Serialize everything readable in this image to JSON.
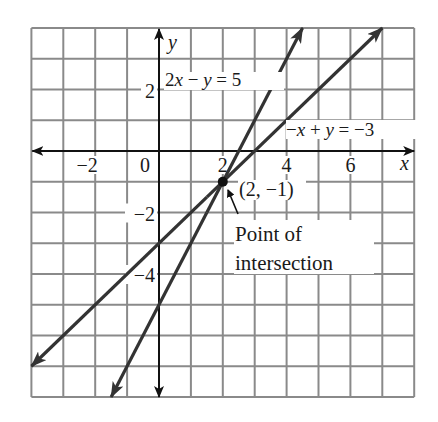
{
  "chart_data": {
    "type": "line",
    "title": "",
    "xlabel": "x",
    "ylabel": "y",
    "xlim": [
      -4,
      8
    ],
    "ylim": [
      -8,
      4
    ],
    "grid": true,
    "x_ticks": [
      {
        "value": -2,
        "label": "−2"
      },
      {
        "value": 0,
        "label": "0"
      },
      {
        "value": 2,
        "label": "2"
      },
      {
        "value": 4,
        "label": "4"
      },
      {
        "value": 6,
        "label": "6"
      }
    ],
    "y_ticks": [
      {
        "value": 2,
        "label": "2"
      },
      {
        "value": -2,
        "label": "−2"
      },
      {
        "value": -4,
        "label": "−4"
      }
    ],
    "series": [
      {
        "name": "2x − y = 5",
        "equation": "y = 2x - 5",
        "slope": 2,
        "intercept": -5,
        "x": [
          -1.5,
          4.5
        ],
        "y": [
          -8,
          4
        ],
        "color": "#333333"
      },
      {
        "name": "−x + y = −3",
        "equation": "y = x - 3",
        "slope": 1,
        "intercept": -3,
        "x": [
          -4,
          7
        ],
        "y": [
          -7,
          4
        ],
        "color": "#333333"
      }
    ],
    "annotations": [
      {
        "text": "2x − y = 5",
        "x": 2.1,
        "y": 2.3
      },
      {
        "text": "−x + y = −3",
        "x": 4.0,
        "y": 0.7
      },
      {
        "text": "(2, −1)",
        "x": 2.5,
        "y": -1.4
      },
      {
        "text": "Point of intersection",
        "x": 2.4,
        "y": -2.8,
        "points_to": [
          2,
          -1
        ]
      }
    ],
    "points": [
      {
        "label": "(2, −1)",
        "x": 2,
        "y": -1
      }
    ]
  },
  "labels": {
    "x_axis": "x",
    "y_axis": "y",
    "eq1_parts": [
      "2",
      "x",
      " − ",
      "y",
      " = 5"
    ],
    "eq2_parts": [
      "−",
      "x",
      " + ",
      "y",
      " = −3"
    ],
    "point_label": "(2, −1)",
    "callout_line1": "Point of",
    "callout_line2": "intersection"
  },
  "style": {
    "grid_color": "#8a8a8a",
    "axis_color": "#111111",
    "line_color": "#333333"
  }
}
